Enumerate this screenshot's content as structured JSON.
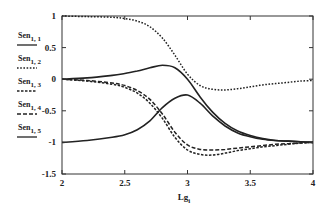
{
  "chart_data": {
    "type": "line",
    "title": "",
    "xlabel": "Lg_i",
    "xlabel_main": "Lg",
    "xlabel_sub": "i",
    "ylabel": "",
    "xlim": [
      2,
      4
    ],
    "ylim": [
      -1.5,
      1
    ],
    "grid": false,
    "legend_position": "left",
    "x_ticks": [
      2,
      2.5,
      3,
      3.5,
      4
    ],
    "x_tick_labels": [
      "2",
      "2.5",
      "3",
      "3.5",
      "4"
    ],
    "y_ticks": [
      1,
      0.5,
      0,
      -0.5,
      -1,
      -1.5
    ],
    "y_tick_labels": [
      "1",
      "0.5",
      "0",
      "-0.5",
      "-1",
      "-1.5"
    ],
    "x": [
      2.0,
      2.2,
      2.4,
      2.5,
      2.6,
      2.7,
      2.8,
      2.9,
      3.0,
      3.1,
      3.2,
      3.3,
      3.4,
      3.5,
      3.6,
      3.7,
      3.8,
      3.9,
      4.0
    ],
    "series": [
      {
        "name": "Sen_1,1",
        "label_main": "Sen",
        "label_sub": "1, 1",
        "style": "solid",
        "values": [
          0.0,
          0.02,
          0.06,
          0.09,
          0.13,
          0.18,
          0.22,
          0.18,
          0.0,
          -0.28,
          -0.52,
          -0.7,
          -0.82,
          -0.89,
          -0.94,
          -0.97,
          -0.98,
          -0.99,
          -1.0
        ]
      },
      {
        "name": "Sen_1,2",
        "label_main": "Sen",
        "label_sub": "1, 2",
        "style": "dotted",
        "values": [
          1.0,
          0.99,
          0.98,
          0.96,
          0.92,
          0.83,
          0.65,
          0.38,
          0.08,
          -0.1,
          -0.16,
          -0.17,
          -0.15,
          -0.12,
          -0.09,
          -0.07,
          -0.05,
          -0.03,
          -0.02
        ]
      },
      {
        "name": "Sen_1,3",
        "label_main": "Sen",
        "label_sub": "1, 3",
        "style": "dashed-fine",
        "values": [
          0.0,
          -0.03,
          -0.08,
          -0.13,
          -0.22,
          -0.38,
          -0.62,
          -0.92,
          -1.12,
          -1.19,
          -1.2,
          -1.17,
          -1.13,
          -1.1,
          -1.07,
          -1.05,
          -1.03,
          -1.01,
          -1.0
        ]
      },
      {
        "name": "Sen_1,4",
        "label_main": "Sen",
        "label_sub": "1, 4",
        "style": "dashed",
        "values": [
          0.0,
          -0.02,
          -0.06,
          -0.1,
          -0.18,
          -0.32,
          -0.55,
          -0.84,
          -1.04,
          -1.11,
          -1.12,
          -1.11,
          -1.09,
          -1.07,
          -1.05,
          -1.03,
          -1.02,
          -1.01,
          -1.0
        ]
      },
      {
        "name": "Sen_1,5",
        "label_main": "Sen",
        "label_sub": "1, 5",
        "style": "solid",
        "values": [
          -1.0,
          -0.97,
          -0.92,
          -0.88,
          -0.8,
          -0.66,
          -0.45,
          -0.3,
          -0.25,
          -0.38,
          -0.58,
          -0.74,
          -0.85,
          -0.91,
          -0.95,
          -0.97,
          -0.98,
          -0.99,
          -1.0
        ]
      }
    ]
  }
}
